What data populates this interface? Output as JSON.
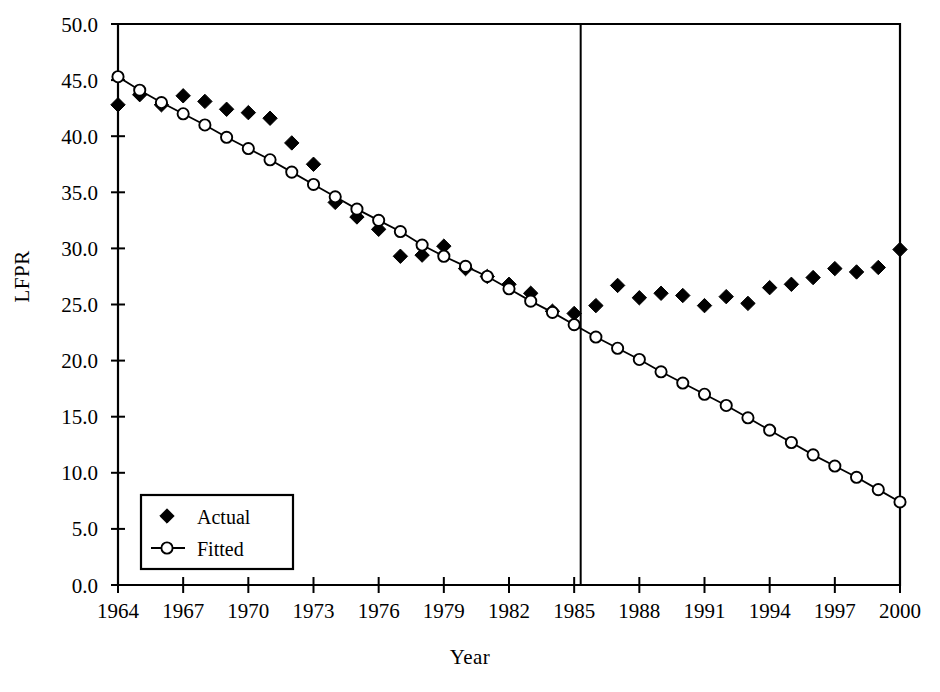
{
  "chart_data": {
    "type": "scatter",
    "title": "",
    "xlabel": "Year",
    "ylabel": "LFPR",
    "xlim": [
      1964,
      2000
    ],
    "ylim": [
      0.0,
      50.0
    ],
    "xticks": [
      "1964",
      "1967",
      "1970",
      "1973",
      "1976",
      "1979",
      "1982",
      "1985",
      "1988",
      "1991",
      "1994",
      "1997",
      "2000"
    ],
    "xtick_values": [
      1964,
      1967,
      1970,
      1973,
      1976,
      1979,
      1982,
      1985,
      1988,
      1991,
      1994,
      1997,
      2000
    ],
    "yticks": [
      "0.0",
      "5.0",
      "10.0",
      "15.0",
      "20.0",
      "25.0",
      "30.0",
      "35.0",
      "40.0",
      "45.0",
      "50.0"
    ],
    "ytick_values": [
      0.0,
      5.0,
      10.0,
      15.0,
      20.0,
      25.0,
      30.0,
      35.0,
      40.0,
      45.0,
      50.0
    ],
    "grid": false,
    "legend_position": "lower-left",
    "annotations": [
      {
        "name": "forecast-divider",
        "type": "vline",
        "x": 1985.3,
        "label": ""
      }
    ],
    "x": [
      1964,
      1965,
      1966,
      1967,
      1968,
      1969,
      1970,
      1971,
      1972,
      1973,
      1974,
      1975,
      1976,
      1977,
      1978,
      1979,
      1980,
      1981,
      1982,
      1983,
      1984,
      1985,
      1986,
      1987,
      1988,
      1989,
      1990,
      1991,
      1992,
      1993,
      1994,
      1995,
      1996,
      1997,
      1998,
      1999,
      2000
    ],
    "series": [
      {
        "name": "Actual",
        "marker": "filled-diamond",
        "line": false,
        "color": "#000000",
        "values": [
          42.8,
          43.7,
          42.8,
          43.6,
          43.1,
          42.4,
          42.1,
          41.6,
          39.4,
          37.5,
          34.1,
          32.8,
          31.7,
          29.3,
          29.4,
          30.2,
          28.2,
          27.5,
          26.8,
          26.0,
          24.4,
          24.2,
          24.9,
          26.7,
          25.6,
          26.0,
          25.8,
          24.9,
          25.7,
          25.1,
          26.5,
          26.8,
          27.4,
          28.2,
          27.9,
          28.3,
          29.9
        ]
      },
      {
        "name": "Fitted",
        "marker": "open-circle",
        "line": true,
        "color": "#000000",
        "values": [
          45.3,
          44.1,
          43.0,
          42.0,
          41.0,
          39.9,
          38.9,
          37.9,
          36.8,
          35.7,
          34.6,
          33.5,
          32.5,
          31.5,
          30.3,
          29.3,
          28.4,
          27.5,
          26.4,
          25.3,
          24.3,
          23.2,
          22.1,
          21.1,
          20.1,
          19.0,
          18.0,
          17.0,
          16.0,
          14.9,
          13.8,
          12.7,
          11.6,
          10.6,
          9.6,
          8.5,
          7.4
        ]
      }
    ]
  },
  "legend": {
    "entries": [
      {
        "label": "Actual",
        "marker": "filled-diamond"
      },
      {
        "label": "Fitted",
        "marker": "open-circle-line"
      }
    ]
  },
  "axes": {
    "y_title": "LFPR",
    "x_title": "Year"
  }
}
